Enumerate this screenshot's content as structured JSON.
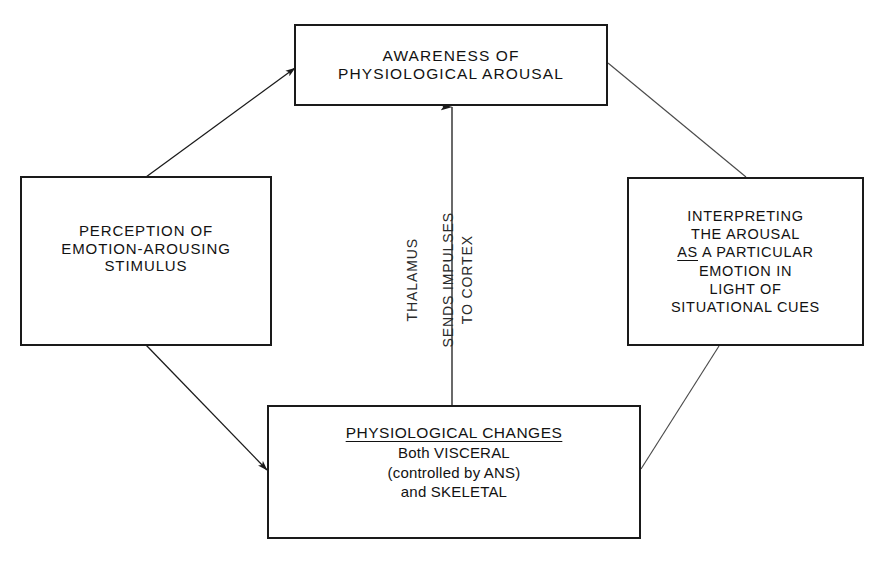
{
  "diagram": {
    "line_color": "#1a1a1a",
    "text_color": "#121212",
    "background": "#ffffff",
    "nodes": {
      "perception": {
        "name": "perception-of-emotion-arousing-stimulus",
        "lines": [
          "PERCEPTION OF",
          "EMOTION-AROUSING",
          "STIMULUS"
        ]
      },
      "awareness": {
        "name": "awareness-of-physiological-arousal",
        "lines": [
          "AWARENESS OF",
          "PHYSIOLOGICAL AROUSAL"
        ]
      },
      "interpreting": {
        "name": "interpreting-the-arousal",
        "lines": [
          "INTERPRETING",
          "THE AROUSAL",
          "AS A PARTICULAR",
          "EMOTION IN",
          "LIGHT OF",
          "SITUATIONAL CUES"
        ],
        "underlined_word": "AS",
        "line3_rest": " A PARTICULAR"
      },
      "physiological": {
        "name": "physiological-changes",
        "heading": "PHYSIOLOGICAL CHANGES",
        "lines": [
          "Both VISCERAL",
          "(controlled by ANS)",
          "and SKELETAL"
        ]
      }
    },
    "arrow_caption": {
      "name": "thalamus-sends-impulses-to-cortex",
      "columns": [
        "THALAMUS",
        "SENDS IMPULSES",
        "TO CORTEX"
      ]
    },
    "connectors": [
      {
        "name": "perception-to-awareness",
        "from": "perception",
        "to": "awareness",
        "arrowhead": true
      },
      {
        "name": "perception-to-physiological",
        "from": "perception",
        "to": "physiological",
        "arrowhead": true
      },
      {
        "name": "physiological-to-awareness",
        "from": "physiological",
        "to": "awareness",
        "arrowhead": true
      },
      {
        "name": "physiological-to-interpreting",
        "from": "physiological",
        "to": "interpreting",
        "arrowhead": false
      },
      {
        "name": "awareness-to-interpreting",
        "from": "awareness",
        "to": "interpreting",
        "arrowhead": false
      }
    ]
  }
}
